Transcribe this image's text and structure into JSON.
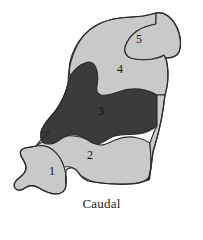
{
  "figure": {
    "title": "",
    "type": "anatomical-region-map",
    "orientation_labels": {
      "left": "Lateral",
      "right": "Medial",
      "bottom": "Caudal"
    },
    "colors": {
      "light_gray": "#c9c9c9",
      "dark_gray": "#3b3b3b",
      "outline": "#2b2b2b",
      "background": "#ffffff",
      "text": "#1a1a1a"
    },
    "regions": [
      {
        "id": "1",
        "label": "1",
        "shade": "light",
        "cx": 52,
        "cy": 172
      },
      {
        "id": "2",
        "label": "2",
        "shade": "light",
        "cx": 90,
        "cy": 156
      },
      {
        "id": "3",
        "label": "3",
        "shade": "dark",
        "cx": 101,
        "cy": 112
      },
      {
        "id": "4",
        "label": "4",
        "shade": "light",
        "cx": 120,
        "cy": 70
      },
      {
        "id": "5",
        "label": "5",
        "shade": "light",
        "cx": 139,
        "cy": 40
      }
    ]
  }
}
